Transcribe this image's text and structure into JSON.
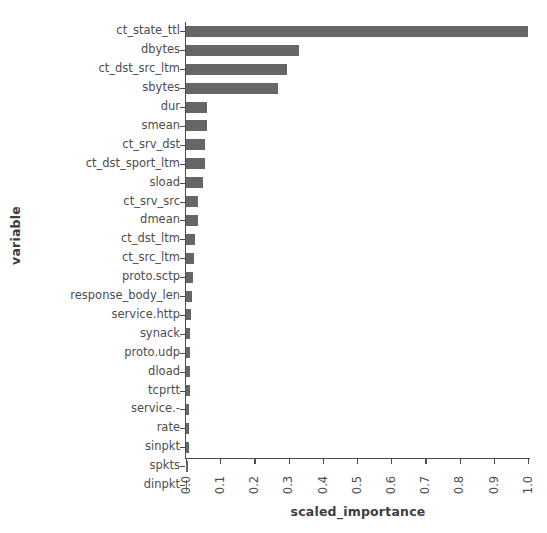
{
  "chart_data": {
    "type": "bar",
    "orientation": "horizontal",
    "title": "",
    "xlabel": "scaled_importance",
    "ylabel": "variable",
    "xlim": [
      0.0,
      1.0
    ],
    "grid": false,
    "legend": null,
    "bar_color": "#666666",
    "axis_color": "#4d4d4d",
    "xticks": [
      "0.0",
      "0.1",
      "0.2",
      "0.3",
      "0.4",
      "0.5",
      "0.6",
      "0.7",
      "0.8",
      "0.9",
      "1.0"
    ],
    "xtick_values": [
      0.0,
      0.1,
      0.2,
      0.3,
      0.4,
      0.5,
      0.6,
      0.7,
      0.8,
      0.9,
      1.0
    ],
    "categories": [
      "ct_state_ttl",
      "dbytes",
      "ct_dst_src_ltm",
      "sbytes",
      "dur",
      "smean",
      "ct_srv_dst",
      "ct_dst_sport_ltm",
      "sload",
      "ct_srv_src",
      "dmean",
      "ct_dst_ltm",
      "ct_src_ltm",
      "proto.sctp",
      "response_body_len",
      "service.http",
      "synack",
      "proto.udp",
      "dload",
      "tcprtt",
      "service.-",
      "rate",
      "sinpkt",
      "spkts",
      "dinpkt"
    ],
    "values": [
      1.0,
      0.33,
      0.295,
      0.268,
      0.062,
      0.06,
      0.055,
      0.055,
      0.05,
      0.034,
      0.034,
      0.026,
      0.024,
      0.021,
      0.018,
      0.014,
      0.013,
      0.012,
      0.011,
      0.011,
      0.01,
      0.009,
      0.008,
      0.007,
      0.004
    ]
  }
}
